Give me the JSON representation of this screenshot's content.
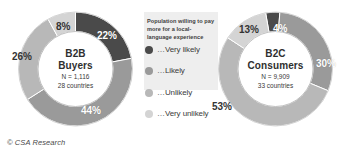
{
  "footer": {
    "credit": "© CSA Research"
  },
  "legend": {
    "title": "Population willing to pay more for a local-language experience",
    "items": [
      {
        "label": "…Very likely",
        "color": "#4a4a4a",
        "key": "very-likely"
      },
      {
        "label": "…Likely",
        "color": "#9a9a9a",
        "key": "likely"
      },
      {
        "label": "…Unlikely",
        "color": "#b8b8b8",
        "key": "unlikely"
      },
      {
        "label": "…Very unlikely",
        "color": "#d4d4d4",
        "key": "very-unlikely"
      }
    ]
  },
  "chart_data": [
    {
      "type": "pie",
      "variant": "donut",
      "id": "b2b",
      "title": "B2B",
      "subtitle": "Buyers",
      "sample_size": "N = 1,116",
      "countries": "28 countries",
      "categories": [
        "…Very likely",
        "…Likely",
        "…Unlikely",
        "…Very unlikely"
      ],
      "values": [
        22,
        44,
        26,
        8
      ],
      "labels": [
        "22%",
        "44%",
        "26%",
        "8%"
      ],
      "colors": [
        "#4a4a4a",
        "#9a9a9a",
        "#b8b8b8",
        "#d4d4d4"
      ],
      "label_text_colors": [
        "#ffffff",
        "#ffffff",
        "#333333",
        "#333333"
      ],
      "legend_position": "center",
      "units": "percent"
    },
    {
      "type": "pie",
      "variant": "donut",
      "id": "b2c",
      "title": "B2C",
      "subtitle": "Consumers",
      "sample_size": "N = 9,909",
      "countries": "33 countries",
      "categories": [
        "…Very likely",
        "…Likely",
        "…Unlikely",
        "…Very unlikely"
      ],
      "values": [
        4,
        30,
        53,
        13
      ],
      "labels": [
        "4%",
        "30%",
        "53%",
        "13%"
      ],
      "colors": [
        "#4a4a4a",
        "#9a9a9a",
        "#b8b8b8",
        "#d4d4d4"
      ],
      "label_text_colors": [
        "#ffffff",
        "#ffffff",
        "#333333",
        "#333333"
      ],
      "legend_position": "center",
      "units": "percent"
    }
  ]
}
